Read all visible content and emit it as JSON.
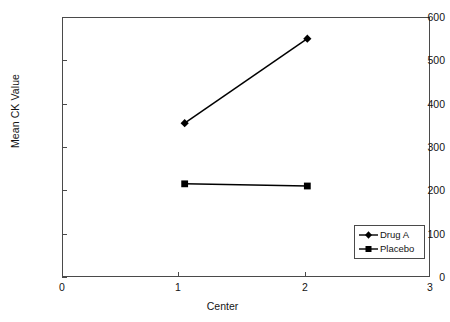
{
  "chart_data": {
    "type": "line",
    "title": "",
    "xlabel": "Center",
    "ylabel": "Mean CK Value",
    "x": [
      1,
      2
    ],
    "xlim": [
      0,
      3
    ],
    "ylim": [
      0,
      600
    ],
    "xticks": [
      "0",
      "1",
      "2",
      "3"
    ],
    "yticks": [
      "0",
      "100",
      "200",
      "300",
      "400",
      "500",
      "600"
    ],
    "grid": false,
    "legend_position": "bottom-right",
    "series": [
      {
        "name": "Drug A",
        "marker": "diamond",
        "color": "#000000",
        "values": [
          355,
          550
        ]
      },
      {
        "name": "Placebo",
        "marker": "square",
        "color": "#000000",
        "values": [
          215,
          210
        ]
      }
    ]
  },
  "axes": {
    "y_title": "Mean CK Value",
    "x_title": "Center",
    "y_tick_labels": [
      "600",
      "500",
      "400",
      "300",
      "200",
      "100",
      "0"
    ],
    "x_tick_labels": [
      "0",
      "1",
      "2",
      "3"
    ]
  },
  "legend": {
    "items": [
      {
        "label": "Drug A",
        "marker": "diamond-marker"
      },
      {
        "label": "Placebo",
        "marker": "square-marker"
      }
    ]
  },
  "colors": {
    "series": "#000000",
    "axis": "#4a4a4a",
    "text": "#141414",
    "background": "#ffffff"
  }
}
